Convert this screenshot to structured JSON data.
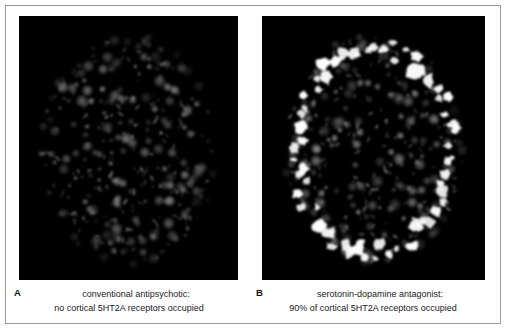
{
  "figure": {
    "background_color": "#ffffff",
    "border_color": "#9b9b9b",
    "panel_background": "#000000"
  },
  "panels": [
    {
      "letter": "A",
      "caption_line_1": "conventional antipsychotic:",
      "caption_line_2": "no cortical 5HT2A receptors occupied",
      "scan_type": "pet-brain-scan",
      "occupancy_percent": 0,
      "bright_blobs_visible": false,
      "dim_blob_color": "#8c8c8c",
      "bright_blob_color": "#ffffff"
    },
    {
      "letter": "B",
      "caption_line_1": "serotonin-dopamine antagonist:",
      "caption_line_2": "90% of cortical 5HT2A receptors occupied",
      "scan_type": "pet-brain-scan",
      "occupancy_percent": 90,
      "bright_blobs_visible": true,
      "dim_blob_color": "#8c8c8c",
      "bright_blob_color": "#ffffff"
    }
  ],
  "scan_data": {
    "type": "image",
    "description": "Two PET brain scan slices shown in axial view comparing cortical 5HT2A receptor occupancy",
    "dim_receptor_blob_count": 210,
    "bright_cortical_blob_count": 62,
    "brain_outline": "oval axial head slice centered in each black panel"
  }
}
